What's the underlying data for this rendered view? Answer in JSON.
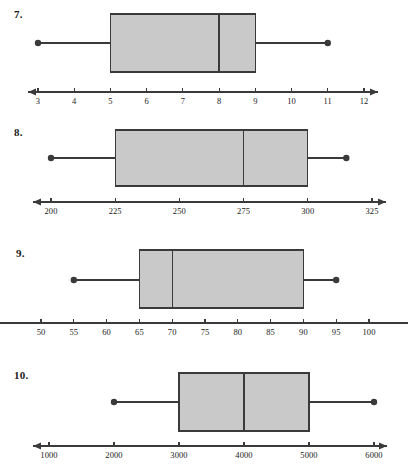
{
  "page": {
    "background": "#ffffff",
    "width": 408,
    "height": 475
  },
  "style": {
    "box_fill": "#c9c9c9",
    "line_color": "#3a3a3a",
    "axis_color": "#3a3a3a",
    "text_color": "#1a1a1a"
  },
  "chart_data": [
    {
      "type": "box",
      "id": "plot-7",
      "number_label": "7.",
      "min": 3,
      "q1": 5,
      "median": 8,
      "q3": 9,
      "max": 11,
      "axis_min": 3,
      "axis_max": 12,
      "tick_values": [
        3,
        4,
        5,
        6,
        7,
        8,
        9,
        10,
        11,
        12
      ],
      "tick_labels": [
        "3",
        "4",
        "5",
        "6",
        "7",
        "8",
        "9",
        "10",
        "11",
        "12"
      ],
      "left_arrow": true,
      "right_arrow": true,
      "title": "",
      "xlabel": "",
      "ylabel": "",
      "grid": false,
      "legend": "none"
    },
    {
      "type": "box",
      "id": "plot-8",
      "number_label": "8.",
      "min": 200,
      "q1": 225,
      "median": 275,
      "q3": 300,
      "max": 315,
      "axis_min": 200,
      "axis_max": 325,
      "tick_values": [
        200,
        225,
        250,
        275,
        300,
        325
      ],
      "tick_labels": [
        "200",
        "225",
        "250",
        "275",
        "300",
        "325"
      ],
      "left_arrow": true,
      "right_arrow": true,
      "title": "",
      "xlabel": "",
      "ylabel": "",
      "grid": false,
      "legend": "none"
    },
    {
      "type": "box",
      "id": "plot-9",
      "number_label": "9.",
      "min": 55,
      "q1": 65,
      "median": 70,
      "q3": 90,
      "max": 95,
      "axis_min": 50,
      "axis_max": 100,
      "tick_values": [
        50,
        55,
        60,
        65,
        70,
        75,
        80,
        85,
        90,
        95,
        100
      ],
      "tick_labels": [
        "50",
        "55",
        "60",
        "65",
        "70",
        "75",
        "80",
        "85",
        "90",
        "95",
        "100"
      ],
      "left_arrow": false,
      "right_arrow": false,
      "title": "",
      "xlabel": "",
      "ylabel": "",
      "grid": false,
      "legend": "none"
    },
    {
      "type": "box",
      "id": "plot-10",
      "number_label": "10.",
      "min": 2000,
      "q1": 3000,
      "median": 4000,
      "q3": 5000,
      "max": 6000,
      "axis_min": 1000,
      "axis_max": 6000,
      "tick_values": [
        1000,
        2000,
        3000,
        4000,
        5000,
        6000
      ],
      "tick_labels": [
        "1000",
        "2000",
        "3000",
        "4000",
        "5000",
        "6000"
      ],
      "left_arrow": true,
      "right_arrow": true,
      "title": "",
      "xlabel": "",
      "ylabel": "",
      "grid": false,
      "legend": "none"
    }
  ],
  "layout": {
    "plots": [
      {
        "top": 0,
        "height": 118,
        "num_x": 14,
        "num_y": 8,
        "axis_y": 92,
        "box_top": 14,
        "box_bottom": 72,
        "whisker_y": 43,
        "px_min": 38,
        "px_max": 364,
        "arrow_left_px": 28,
        "arrow_right_px": 378
      },
      {
        "top": 118,
        "height": 117,
        "num_x": 14,
        "num_y": 8,
        "axis_y": 84,
        "box_top": 12,
        "box_bottom": 68,
        "whisker_y": 40,
        "px_min": 51,
        "px_max": 372,
        "arrow_left_px": 33,
        "arrow_right_px": 386
      },
      {
        "top": 235,
        "height": 120,
        "num_x": 16,
        "num_y": 12,
        "axis_y": 88,
        "box_top": 15,
        "box_bottom": 73,
        "whisker_y": 45,
        "px_min": 41,
        "px_max": 369,
        "arrow_left_px": 32,
        "arrow_right_px": 382
      },
      {
        "top": 355,
        "height": 120,
        "num_x": 14,
        "num_y": 14,
        "axis_y": 91,
        "box_top": 18,
        "box_bottom": 76,
        "whisker_y": 47,
        "px_min": 49,
        "px_max": 374,
        "arrow_left_px": 33,
        "arrow_right_px": 387
      }
    ]
  }
}
